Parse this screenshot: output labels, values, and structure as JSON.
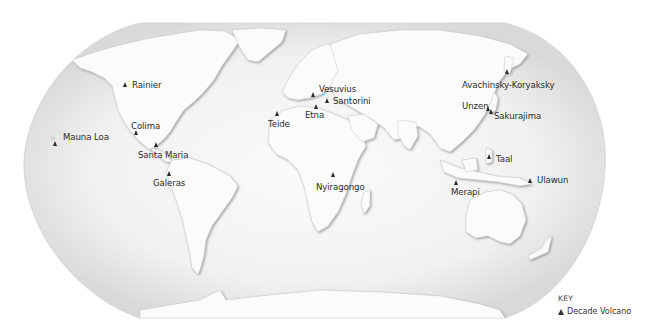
{
  "map": {
    "projection": "Robinson-style world map",
    "palette": {
      "ocean": "#f2f2f2",
      "ocean_edge": "#d4d4d4",
      "land": "#fafafa",
      "land_shade": "#b9b9b9",
      "marker": "#2a2a2a",
      "label": "#2b2b2b"
    },
    "volcanoes": [
      {
        "name": "Rainier",
        "marker": [
          125,
          86
        ],
        "label": [
          133,
          81
        ]
      },
      {
        "name": "Colima",
        "marker": [
          136,
          134
        ],
        "label": [
          131,
          123
        ]
      },
      {
        "name": "Mauna Loa",
        "marker": [
          55,
          145
        ],
        "label": [
          63,
          133
        ]
      },
      {
        "name": "Santa Maria",
        "marker": [
          156,
          146
        ],
        "label": [
          138,
          151
        ]
      },
      {
        "name": "Galeras",
        "marker": [
          169,
          173
        ],
        "label": [
          153,
          178
        ]
      },
      {
        "name": "Teide",
        "marker": [
          277,
          114
        ],
        "label": [
          268,
          120
        ]
      },
      {
        "name": "Etna",
        "marker": [
          316,
          109
        ],
        "label": [
          305,
          111
        ]
      },
      {
        "name": "Vesuvius",
        "marker": [
          313,
          97
        ],
        "label": [
          319,
          85
        ]
      },
      {
        "name": "Santorini",
        "marker": [
          327,
          102
        ],
        "label": [
          333,
          97
        ]
      },
      {
        "name": "Avachinsky-Koryaksky",
        "marker": [
          507,
          73
        ],
        "label": [
          462,
          81
        ]
      },
      {
        "name": "Unzen",
        "marker": [
          488,
          109
        ],
        "label": [
          462,
          102
        ]
      },
      {
        "name": "Sakurajima",
        "marker": [
          490,
          112
        ],
        "label": [
          494,
          112
        ]
      },
      {
        "name": "Taal",
        "marker": [
          489,
          157
        ],
        "label": [
          496,
          155
        ]
      },
      {
        "name": "Merapi",
        "marker": [
          456,
          183
        ],
        "label": [
          451,
          188
        ]
      },
      {
        "name": "Nyiragongo",
        "marker": [
          333,
          175
        ],
        "label": [
          316,
          183
        ]
      },
      {
        "name": "Ulawun",
        "marker": [
          530,
          181
        ],
        "label": [
          537,
          176
        ]
      }
    ]
  },
  "key": {
    "title": "KEY",
    "entry_symbol": "▲",
    "entry_label": "Decade Volcano"
  }
}
